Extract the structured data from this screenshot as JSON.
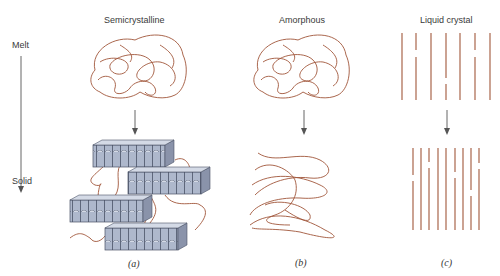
{
  "figure": {
    "axis": {
      "top_label": "Melt",
      "bottom_label": "Solid"
    },
    "panels": [
      {
        "id": "a",
        "title": "Semicrystalline",
        "caption": "(a)"
      },
      {
        "id": "b",
        "title": "Amorphous",
        "caption": "(b)"
      },
      {
        "id": "c",
        "title": "Liquid crystal",
        "caption": "(c)"
      }
    ],
    "colors": {
      "chain": "#a0563a",
      "crystal_fill": "#aeb8cc",
      "crystal_edge": "#4a5266",
      "arrow": "#555555"
    }
  }
}
